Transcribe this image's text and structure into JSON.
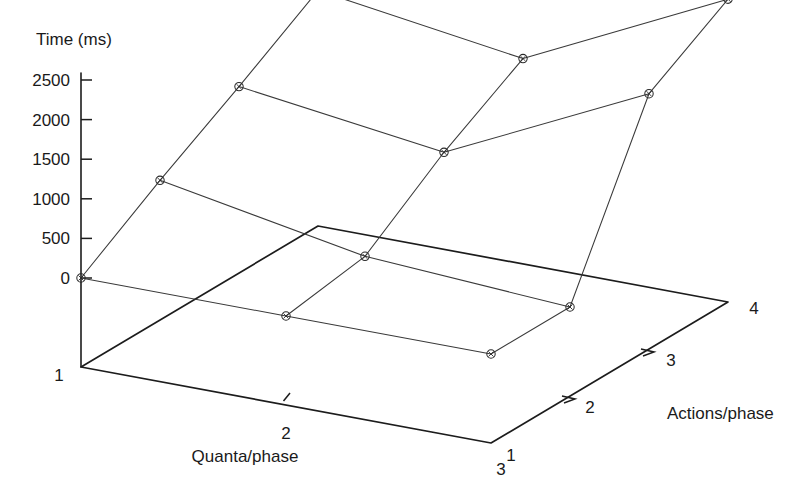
{
  "chart_data": {
    "type": "line",
    "title": "",
    "projection": "3d-surface-wireframe",
    "zlabel": "Time (ms)",
    "xlabel": "Quanta/phase",
    "ylabel": "Actions/phase",
    "z_ticks": [
      0,
      500,
      1000,
      1500,
      2000,
      2500
    ],
    "z_tick_labels": [
      "0",
      "500",
      "1000",
      "1500",
      "2000",
      "2500"
    ],
    "zlim": [
      0,
      2500
    ],
    "x_categories": [
      "1",
      "2",
      "3"
    ],
    "y_categories": [
      "1",
      "2",
      "3",
      "4"
    ],
    "grid": false,
    "legend": "none",
    "marker": "circle-x",
    "series": [
      {
        "name": "Quanta/phase = 1",
        "quanta": 1,
        "points": [
          {
            "actions": 1,
            "time": 0
          },
          {
            "actions": 2,
            "time": 640
          },
          {
            "actions": 3,
            "time": 1230
          },
          {
            "actions": 4,
            "time": 1850
          }
        ]
      },
      {
        "name": "Quanta/phase = 2",
        "quanta": 2,
        "points": [
          {
            "actions": 1,
            "time": 0
          },
          {
            "actions": 2,
            "time": 160
          },
          {
            "actions": 3,
            "time": 880
          },
          {
            "actions": 4,
            "time": 1470
          }
        ]
      },
      {
        "name": "Quanta/phase = 3",
        "quanta": 3,
        "points": [
          {
            "actions": 1,
            "time": 0
          },
          {
            "actions": 2,
            "time": 0
          },
          {
            "actions": 3,
            "time": 2100
          },
          {
            "actions": 4,
            "time": 2700
          }
        ]
      }
    ],
    "colors": {
      "axis": "#1c1c1c",
      "mesh": "#3a3a3a",
      "marker": "#2a2a2a",
      "background": "#ffffff"
    }
  },
  "axes": {
    "z": {
      "title": "Time (ms)",
      "ticks": [
        {
          "label": "2500",
          "value": 2500
        },
        {
          "label": "2000",
          "value": 2000
        },
        {
          "label": "1500",
          "value": 1500
        },
        {
          "label": "1000",
          "value": 1000
        },
        {
          "label": "500",
          "value": 500
        },
        {
          "label": "0",
          "value": 0
        }
      ]
    },
    "x": {
      "title": "Quanta/phase",
      "ticks": [
        {
          "label": "1",
          "value": 1
        },
        {
          "label": "2",
          "value": 2
        },
        {
          "label": "3",
          "value": 3
        }
      ]
    },
    "y": {
      "title": "Actions/phase",
      "ticks": [
        {
          "label": "1",
          "value": 1
        },
        {
          "label": "2",
          "value": 2
        },
        {
          "label": "3",
          "value": 3
        },
        {
          "label": "4",
          "value": 4
        }
      ]
    }
  }
}
